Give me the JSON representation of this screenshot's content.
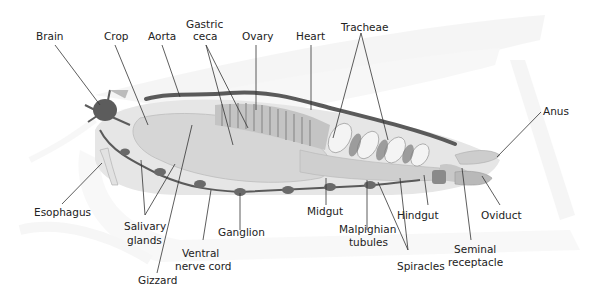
{
  "diagram": {
    "colors": {
      "background": "#ffffff",
      "ghost_outline": "#ececec",
      "organ_light": "#dcdcdc",
      "organ_mid": "#b8b8b8",
      "organ_dark": "#6e6e6e",
      "nerve_vessel": "#5a5a5a",
      "label_text": "#222222",
      "leader_line": "#333333"
    },
    "labels": {
      "brain": "Brain",
      "crop": "Crop",
      "aorta": "Aorta",
      "gastric_ceca_1": "Gastric",
      "gastric_ceca_2": "ceca",
      "ovary": "Ovary",
      "heart": "Heart",
      "tracheae": "Tracheae",
      "anus": "Anus",
      "esophagus": "Esophagus",
      "salivary_glands_1": "Salivary",
      "salivary_glands_2": "glands",
      "gizzard": "Gizzard",
      "ventral_nerve_cord_1": "Ventral",
      "ventral_nerve_cord_2": "nerve cord",
      "ganglion": "Ganglion",
      "midgut": "Midgut",
      "malpighian_tubules_1": "Malpighian",
      "malpighian_tubules_2": "tubules",
      "spiracles": "Spiracles",
      "hindgut": "Hindgut",
      "seminal_receptacle_1": "Seminal",
      "seminal_receptacle_2": "receptacle",
      "oviduct": "Oviduct"
    }
  }
}
